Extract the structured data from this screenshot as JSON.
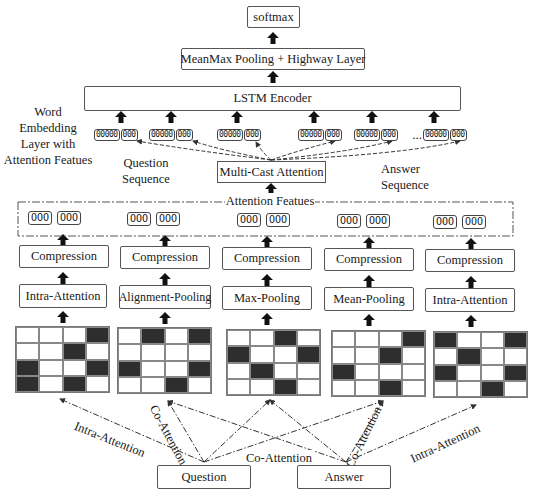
{
  "diagram": {
    "top": {
      "softmax": "softmax",
      "pooling_highway": "MeanMax Pooling + Highway Layer",
      "lstm": "LSTM Encoder"
    },
    "embedding_label": [
      "Word",
      "Embedding",
      "Layer with",
      "Attention Featues"
    ],
    "question_sequence_label": [
      "Question",
      "Sequence"
    ],
    "answer_sequence_label": [
      "Answer",
      "Sequence"
    ],
    "multicast": "Multi-Cast Attention",
    "attention_features_label": "Attention Featues",
    "ellipsis": "...",
    "vector": {
      "word_part": "00000",
      "feat_part": "000"
    },
    "feature_vec": "OOO",
    "question_vectors": 3,
    "answer_vectors": 3,
    "columns": [
      {
        "compression": "Compression",
        "operation": "Intra-Attention",
        "matrix": [
          [
            0,
            0,
            0,
            1
          ],
          [
            0,
            0,
            1,
            0
          ],
          [
            1,
            0,
            0,
            1
          ],
          [
            1,
            0,
            1,
            0
          ]
        ]
      },
      {
        "compression": "Compression",
        "operation": "Alignment-Pooling",
        "matrix": [
          [
            0,
            1,
            0,
            1
          ],
          [
            0,
            0,
            0,
            0
          ],
          [
            1,
            0,
            0,
            1
          ],
          [
            0,
            0,
            1,
            0
          ]
        ]
      },
      {
        "compression": "Compression",
        "operation": "Max-Pooling",
        "matrix": [
          [
            0,
            0,
            1,
            0
          ],
          [
            1,
            0,
            0,
            1
          ],
          [
            0,
            1,
            0,
            0
          ],
          [
            0,
            0,
            1,
            0
          ]
        ]
      },
      {
        "compression": "Compression",
        "operation": "Mean-Pooling",
        "matrix": [
          [
            0,
            0,
            0,
            1
          ],
          [
            0,
            0,
            1,
            0
          ],
          [
            1,
            0,
            0,
            0
          ],
          [
            0,
            0,
            1,
            0
          ]
        ]
      },
      {
        "compression": "Compression",
        "operation": "Intra-Attention",
        "matrix": [
          [
            1,
            0,
            0,
            1
          ],
          [
            0,
            1,
            0,
            0
          ],
          [
            1,
            0,
            0,
            1
          ],
          [
            0,
            0,
            1,
            0
          ]
        ]
      }
    ],
    "inputs": {
      "question": "Question",
      "answer": "Answer"
    },
    "edge_labels": {
      "q_intra": "Intra-Attention",
      "q_co": "Co-Attention",
      "center_co": "Co-Attention",
      "a_co": "Co-Attention",
      "a_intra": "Intra-Attention"
    },
    "colors": {
      "line": "#333333",
      "filled_cell": "#2e2e2e",
      "border": "#555555"
    }
  }
}
